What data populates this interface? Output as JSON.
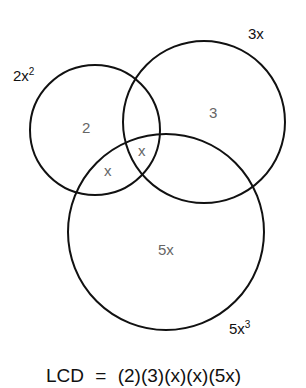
{
  "diagram": {
    "type": "venn",
    "circles": [
      {
        "id": "a",
        "label_base": "2x",
        "label_exp": "2",
        "cx": 95,
        "cy": 130,
        "r": 65,
        "stroke": "#111111"
      },
      {
        "id": "b",
        "label_base": "3x",
        "label_exp": "",
        "cx": 204,
        "cy": 122,
        "r": 81,
        "stroke": "#111111"
      },
      {
        "id": "c",
        "label_base": "5x",
        "label_exp": "3",
        "cx": 166,
        "cy": 232,
        "r": 98,
        "stroke": "#111111"
      }
    ],
    "regions": {
      "a_only": "2",
      "b_only": "3",
      "a_and_c": "x",
      "a_b_c": "x",
      "c_only": "5x"
    },
    "equation": {
      "lhs": "LCD",
      "op": "=",
      "rhs": "(2)(3)(x)(x)(5x)"
    },
    "colors": {
      "stroke": "#111111",
      "region_text": "#666666",
      "label_text": "#111111",
      "background": "#ffffff"
    }
  }
}
